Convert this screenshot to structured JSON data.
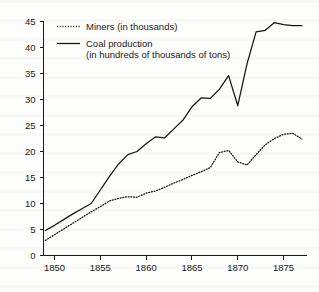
{
  "figure": {
    "background_color": "#fdfdfc",
    "ink_color": "#141414"
  },
  "legend": {
    "position": "top-left-inside",
    "entries": [
      {
        "swatch": "dotted-line-swatch",
        "line_style": "dotted",
        "label": "Miners (in thousands)",
        "label_line_2": ""
      },
      {
        "swatch": "solid-line-swatch",
        "line_style": "solid",
        "label": "Coal production",
        "label_line_2": "(in hundreds of thousands of tons)"
      }
    ]
  },
  "axes": {
    "x": {
      "label": "",
      "tick_labels": [
        "1850",
        "1855",
        "1860",
        "1865",
        "1870",
        "1875"
      ],
      "tick_values": [
        1850,
        1855,
        1860,
        1865,
        1870,
        1875
      ],
      "range": [
        1848.8,
        1877.5
      ]
    },
    "y": {
      "label": "",
      "tick_labels": [
        "0",
        "5",
        "10",
        "15",
        "20",
        "25",
        "30",
        "35",
        "40",
        "45"
      ],
      "tick_values": [
        0,
        5,
        10,
        15,
        20,
        25,
        30,
        35,
        40,
        45
      ],
      "range": [
        0,
        45
      ]
    }
  },
  "chart_data": {
    "type": "line",
    "title": "",
    "subtitle": "",
    "xlabel": "",
    "ylabel": "",
    "xlim": [
      1848.8,
      1877.5
    ],
    "ylim": [
      0,
      45
    ],
    "grid": false,
    "legend_position": "upper left (inside axes)",
    "x": [
      1849,
      1850,
      1851,
      1852,
      1853,
      1854,
      1855,
      1856,
      1857,
      1858,
      1859,
      1860,
      1861,
      1862,
      1863,
      1864,
      1865,
      1866,
      1867,
      1868,
      1869,
      1870,
      1871,
      1872,
      1873,
      1874,
      1875,
      1876,
      1877
    ],
    "series": [
      {
        "name": "Coal production (in hundreds of thousands of tons)",
        "line_style": "solid",
        "units": "hundreds of thousands of tons",
        "values": [
          4.8,
          5.8,
          6.9,
          8.0,
          9.0,
          10.0,
          12.6,
          15.2,
          17.6,
          19.4,
          20.0,
          21.5,
          22.8,
          22.6,
          24.3,
          26.0,
          28.6,
          30.3,
          30.2,
          32.0,
          34.6,
          28.8,
          36.8,
          43.0,
          43.3,
          44.8,
          44.4,
          44.2,
          44.2
        ]
      },
      {
        "name": "Miners (in thousands)",
        "line_style": "dotted",
        "units": "thousands",
        "values": [
          2.9,
          4.0,
          5.1,
          6.2,
          7.3,
          8.4,
          9.4,
          10.5,
          11.0,
          11.3,
          11.2,
          12.0,
          12.4,
          13.1,
          13.9,
          14.6,
          15.4,
          16.1,
          16.9,
          19.8,
          20.2,
          18.0,
          17.4,
          19.4,
          21.3,
          22.5,
          23.3,
          23.5,
          22.4
        ]
      }
    ]
  }
}
